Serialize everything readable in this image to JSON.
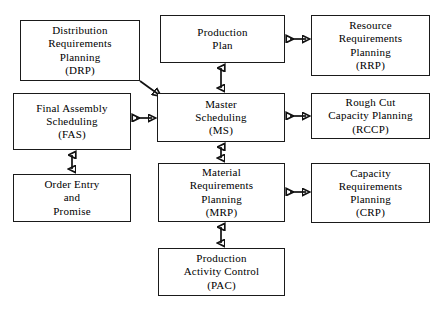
{
  "diagram": {
    "background_color": "#ffffff",
    "line_color": "#111111",
    "box_border_color": "#1a1a1a",
    "text_color": "#000000",
    "nodes": [
      {
        "id": "drp",
        "name": "distribution-requirements-planning",
        "lines": [
          "Distribution",
          "Requirements",
          "Planning",
          "(DRP)"
        ],
        "x": 20,
        "y": 20,
        "w": 120,
        "h": 61
      },
      {
        "id": "production-plan",
        "name": "production-plan",
        "lines": [
          "Production",
          "Plan"
        ],
        "x": 160,
        "y": 15,
        "w": 125,
        "h": 48
      },
      {
        "id": "rrp",
        "name": "resource-requirements-planning",
        "lines": [
          "Resource",
          "Requirements",
          "Planning",
          "(RRP)"
        ],
        "x": 311,
        "y": 15,
        "w": 119,
        "h": 61
      },
      {
        "id": "fas",
        "name": "final-assembly-scheduling",
        "lines": [
          "Final Assembly",
          "Scheduling",
          "(FAS)"
        ],
        "x": 13,
        "y": 93,
        "w": 118,
        "h": 57
      },
      {
        "id": "ms",
        "name": "master-scheduling",
        "lines": [
          "Master",
          "Scheduling",
          "(MS)"
        ],
        "x": 157,
        "y": 93,
        "w": 128,
        "h": 49
      },
      {
        "id": "rccp",
        "name": "rough-cut-capacity-planning",
        "lines": [
          "Rough Cut",
          "Capacity Planning",
          "(RCCP)"
        ],
        "x": 311,
        "y": 93,
        "w": 119,
        "h": 46
      },
      {
        "id": "order-entry",
        "name": "order-entry-and-promise",
        "lines": [
          "Order Entry",
          "and",
          "Promise"
        ],
        "x": 13,
        "y": 174,
        "w": 118,
        "h": 48
      },
      {
        "id": "mrp",
        "name": "material-requirements-planning",
        "lines": [
          "Material",
          "Requirements",
          "Planning",
          "(MRP)"
        ],
        "x": 158,
        "y": 163,
        "w": 127,
        "h": 59
      },
      {
        "id": "crp",
        "name": "capacity-requirements-planning",
        "lines": [
          "Capacity",
          "Requirements",
          "Planning",
          "(CRP)"
        ],
        "x": 311,
        "y": 163,
        "w": 119,
        "h": 60
      },
      {
        "id": "pac",
        "name": "production-activity-control",
        "lines": [
          "Production",
          "Activity Control",
          "(PAC)"
        ],
        "x": 158,
        "y": 248,
        "w": 127,
        "h": 48
      }
    ],
    "connectors": [
      {
        "id": "pp-rrp",
        "name": "connector-production-plan-to-rrp",
        "type": "double-arrow-horizontal",
        "from": "production-plan",
        "to": "rrp"
      },
      {
        "id": "pp-ms",
        "name": "connector-production-plan-to-master-scheduling",
        "type": "double-arrow-vertical",
        "from": "production-plan",
        "to": "ms"
      },
      {
        "id": "drp-ms",
        "name": "connector-drp-to-master-scheduling",
        "type": "single-arrow-diagonal",
        "from": "drp",
        "to": "ms"
      },
      {
        "id": "fas-ms",
        "name": "connector-fas-to-master-scheduling",
        "type": "double-arrow-horizontal",
        "from": "fas",
        "to": "ms"
      },
      {
        "id": "ms-rccp",
        "name": "connector-master-scheduling-to-rccp",
        "type": "double-arrow-horizontal",
        "from": "ms",
        "to": "rccp"
      },
      {
        "id": "fas-order",
        "name": "connector-fas-to-order-entry",
        "type": "double-arrow-vertical",
        "from": "fas",
        "to": "order-entry"
      },
      {
        "id": "ms-mrp",
        "name": "connector-master-scheduling-to-mrp",
        "type": "double-arrow-vertical",
        "from": "ms",
        "to": "mrp"
      },
      {
        "id": "mrp-crp",
        "name": "connector-mrp-to-crp",
        "type": "double-arrow-horizontal",
        "from": "mrp",
        "to": "crp"
      },
      {
        "id": "mrp-pac",
        "name": "connector-mrp-to-pac",
        "type": "double-arrow-vertical",
        "from": "mrp",
        "to": "pac"
      }
    ]
  }
}
